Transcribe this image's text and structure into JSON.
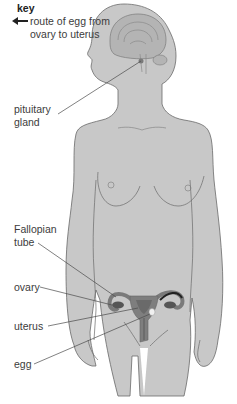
{
  "key": {
    "title": "key",
    "arrow_icon": "left-arrow-icon",
    "description": "route of egg from ovary to uterus"
  },
  "labels": {
    "pituitary": "pituitary gland",
    "pituitary_line1": "pituitary",
    "pituitary_line2": "gland",
    "fallopian_line1": "Fallopian",
    "fallopian_line2": "tube",
    "ovary": "ovary",
    "uterus": "uterus",
    "egg": "egg"
  },
  "colors": {
    "body_fill": "#c8c8c8",
    "outline": "#6a6a6a",
    "organ_dark": "#6e6e6e",
    "organ_mid": "#8a8a8a",
    "leader_line": "#4a4a4a",
    "arrow": "#222222"
  }
}
